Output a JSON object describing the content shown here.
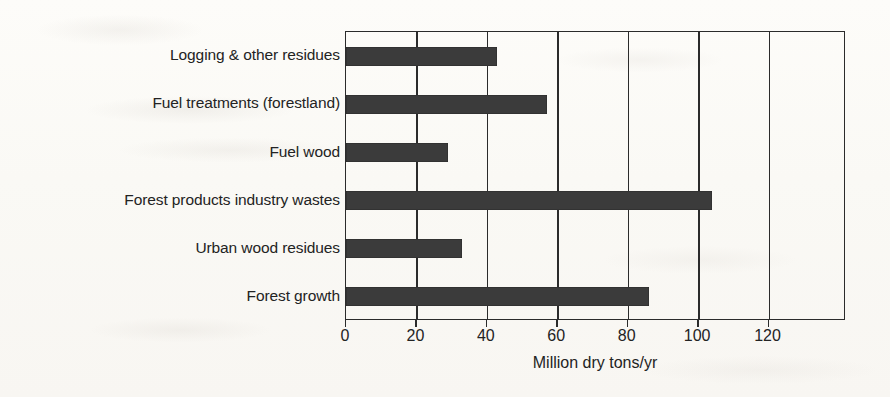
{
  "chart_data": {
    "type": "bar",
    "orientation": "horizontal",
    "title": "",
    "subtitle": "",
    "xlabel": "Million dry tons/yr",
    "ylabel": "",
    "categories": [
      "Logging & other residues",
      "Fuel treatments (forestland)",
      "Fuel wood",
      "Forest products industry wastes",
      "Urban wood residues",
      "Forest growth"
    ],
    "values": [
      43,
      57,
      29,
      104,
      33,
      86
    ],
    "series": [
      {
        "name": "Million dry tons/yr",
        "values": [
          43,
          57,
          29,
          104,
          33,
          86
        ]
      }
    ],
    "xlim": [
      0,
      142
    ],
    "xticks": [
      0,
      20,
      40,
      60,
      80,
      100,
      120
    ],
    "xticklabels": [
      "0",
      "20",
      "40",
      "60",
      "80",
      "100",
      "120"
    ],
    "grid": "vertical-major",
    "legend": "none",
    "bar_color": "#3b3b3b",
    "axis_color": "#2b2b2b",
    "background_color": "#fbfaf7"
  },
  "axis": {
    "x_title": "Million dry tons/yr"
  }
}
